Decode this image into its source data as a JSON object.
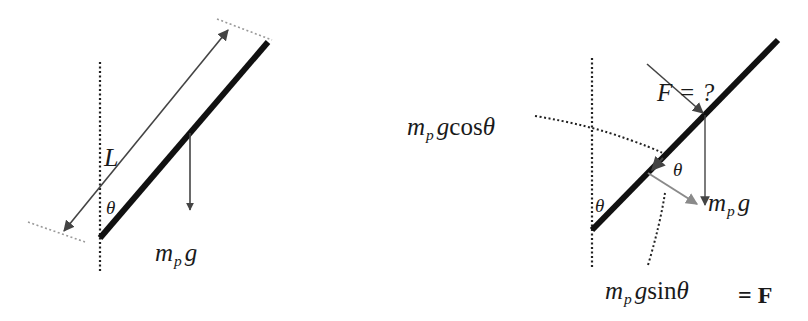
{
  "diagram": {
    "colors": {
      "rod": "#111111",
      "arrow": "#444444",
      "component_arrow": "#8a8a8a",
      "dotted_reference": "#222222",
      "dotted_marker": "#9a9a9a",
      "text": "#1a1a1a"
    },
    "left_panel": {
      "length_label": "L",
      "angle_label": "θ",
      "weight_label": {
        "mass": "m",
        "subscript": "p",
        "gravity": "g"
      }
    },
    "right_panel": {
      "force_label": "F = ?",
      "angle_label_rod": "θ",
      "angle_label_component": "θ",
      "weight_label": {
        "mass": "m",
        "subscript": "p",
        "gravity": "g"
      },
      "cos_component_label": {
        "mass": "m",
        "subscript": "p",
        "gravity": "g",
        "func": "cos",
        "angle": "θ"
      },
      "sin_component_label": {
        "mass": "m",
        "subscript": "p",
        "gravity": "g",
        "func": "sin",
        "angle": "θ"
      },
      "equals_f": "= F"
    }
  }
}
